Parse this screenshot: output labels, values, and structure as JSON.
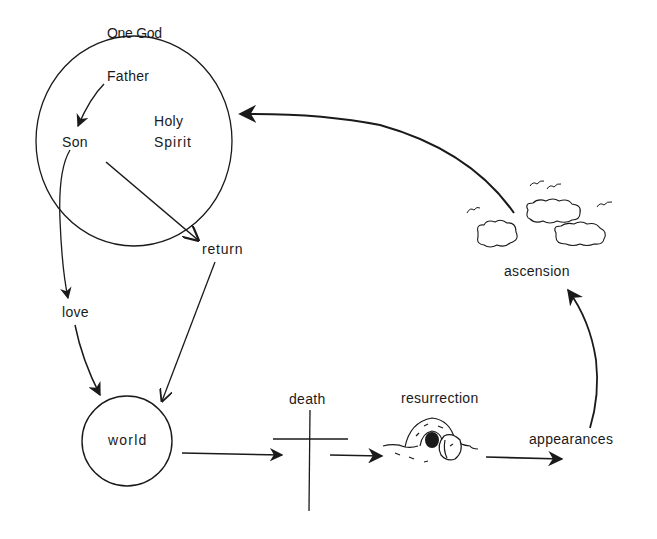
{
  "diagram": {
    "colors": {
      "ink": "#1a1a1a",
      "background": "#ffffff"
    },
    "nodes": {
      "god": {
        "label": "One God"
      },
      "father": {
        "label": "Father"
      },
      "son": {
        "label": "Son"
      },
      "holy_spirit": {
        "label_line1": "Holy",
        "label_line2": "Spirit"
      },
      "return": {
        "label": "return"
      },
      "love": {
        "label": "love"
      },
      "world": {
        "label": "world"
      },
      "death": {
        "label": "death",
        "icon": "cross-icon"
      },
      "resurrection": {
        "label": "resurrection",
        "icon": "tomb-icon"
      },
      "appearances": {
        "label": "appearances"
      },
      "ascension": {
        "label": "ascension",
        "icon": "clouds-icon"
      }
    },
    "edges": [
      {
        "from": "Father",
        "to": "Son"
      },
      {
        "from": "Son",
        "to": "love"
      },
      {
        "from": "love",
        "to": "world"
      },
      {
        "from": "Son",
        "to": "return"
      },
      {
        "from": "return",
        "to": "world"
      },
      {
        "from": "world",
        "to": "death"
      },
      {
        "from": "death",
        "to": "resurrection"
      },
      {
        "from": "resurrection",
        "to": "appearances"
      },
      {
        "from": "appearances",
        "to": "ascension"
      },
      {
        "from": "ascension",
        "to": "One God"
      }
    ]
  }
}
